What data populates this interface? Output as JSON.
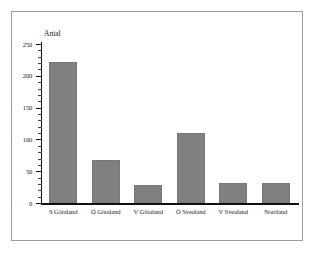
{
  "chart_data": {
    "type": "bar",
    "title": "",
    "subtitle": "",
    "xlabel": "",
    "ylabel": "Antal",
    "categories": [
      "S Götaland",
      "Ö Götaland",
      "V Götaland",
      "Ö Svealand",
      "V Svealand",
      "Norrland"
    ],
    "values": [
      222,
      67,
      29,
      110,
      32,
      31
    ],
    "ylim": [
      0,
      250
    ],
    "ytick_labels": [
      "0",
      "50",
      "100",
      "150",
      "200",
      "250"
    ],
    "ytick_values": [
      0,
      50,
      100,
      150,
      200,
      250
    ],
    "minor_tick_step": 10,
    "grid": false,
    "legend": null,
    "bar_color": "#808080",
    "axis_color": "#111111",
    "frame_color": "#9b9b9b",
    "background": "#ffffff"
  }
}
